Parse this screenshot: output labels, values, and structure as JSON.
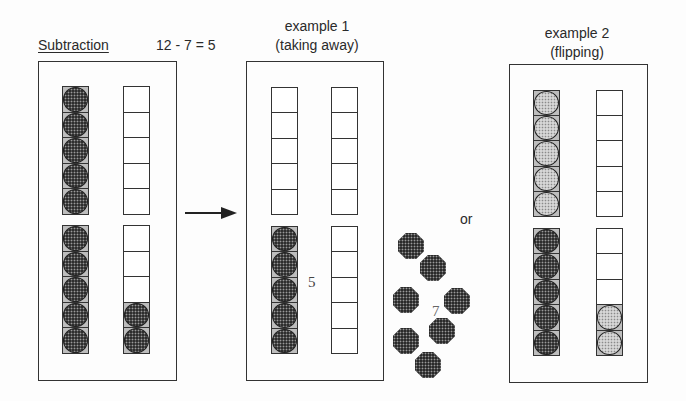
{
  "header": {
    "title": "Subtraction",
    "equation": "12 - 7 = 5"
  },
  "example1": {
    "line1": "example 1",
    "line2": "(taking away)",
    "remaining_label": "5",
    "taken_label": "7",
    "taken_count": 7
  },
  "connector": {
    "or_label": "or"
  },
  "example2": {
    "line1": "example 2",
    "line2": "(flipping)"
  },
  "panels": [
    {
      "name": "start",
      "box": {
        "left": 38,
        "top": 61,
        "width": 139,
        "height": 320
      },
      "columns": [
        {
          "left": 62,
          "top": 86,
          "height": 129,
          "cells": [
            "dark",
            "dark",
            "dark",
            "dark",
            "dark"
          ]
        },
        {
          "left": 123,
          "top": 86,
          "height": 129,
          "cells": [
            "empty",
            "empty",
            "empty",
            "empty",
            "empty"
          ]
        },
        {
          "left": 62,
          "top": 225,
          "height": 129,
          "cells": [
            "dark",
            "dark",
            "dark",
            "dark",
            "dark"
          ]
        },
        {
          "left": 123,
          "top": 225,
          "height": 129,
          "cells": [
            "empty",
            "empty",
            "empty",
            "dark",
            "dark"
          ]
        }
      ]
    },
    {
      "name": "example1",
      "box": {
        "left": 246,
        "top": 61,
        "width": 138,
        "height": 320
      },
      "columns": [
        {
          "left": 271,
          "top": 87,
          "height": 128,
          "cells": [
            "empty",
            "empty",
            "empty",
            "empty",
            "empty"
          ]
        },
        {
          "left": 331,
          "top": 87,
          "height": 128,
          "cells": [
            "empty",
            "empty",
            "empty",
            "empty",
            "empty"
          ]
        },
        {
          "left": 271,
          "top": 226,
          "height": 128,
          "cells": [
            "dark",
            "dark",
            "dark",
            "dark",
            "dark"
          ]
        },
        {
          "left": 331,
          "top": 226,
          "height": 128,
          "cells": [
            "empty",
            "empty",
            "empty",
            "empty",
            "empty"
          ]
        }
      ]
    },
    {
      "name": "example2",
      "box": {
        "left": 509,
        "top": 64,
        "width": 139,
        "height": 319
      },
      "columns": [
        {
          "left": 533,
          "top": 90,
          "height": 127,
          "cells": [
            "light",
            "light",
            "light",
            "light",
            "light"
          ]
        },
        {
          "left": 596,
          "top": 90,
          "height": 127,
          "cells": [
            "empty",
            "empty",
            "empty",
            "empty",
            "empty"
          ]
        },
        {
          "left": 533,
          "top": 228,
          "height": 128,
          "cells": [
            "dark",
            "dark",
            "dark",
            "dark",
            "dark"
          ]
        },
        {
          "left": 596,
          "top": 228,
          "height": 128,
          "cells": [
            "empty",
            "empty",
            "empty",
            "light",
            "light"
          ]
        }
      ]
    }
  ],
  "loose_counters": [
    {
      "x": 411,
      "y": 246
    },
    {
      "x": 433,
      "y": 268
    },
    {
      "x": 406,
      "y": 300
    },
    {
      "x": 457,
      "y": 301
    },
    {
      "x": 442,
      "y": 331
    },
    {
      "x": 406,
      "y": 341
    },
    {
      "x": 428,
      "y": 365
    }
  ],
  "colors": {
    "ink": "#333333",
    "dark_counter": "#2e2e2e",
    "light_counter": "#d6d6d6",
    "background": "#fdfdfd"
  }
}
